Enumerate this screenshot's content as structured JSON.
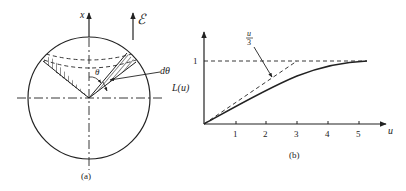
{
  "figure_a": {
    "caption": "(a)",
    "axis_label": "x",
    "field_label": "ℰ",
    "angle_label": "θ",
    "dangle_label": "dθ"
  },
  "figure_b": {
    "caption": "(b)",
    "ylabel": "L(u)",
    "xlabel": "u",
    "y_tick": "1",
    "x_ticks": [
      "1",
      "2",
      "3",
      "4",
      "5"
    ],
    "annotation_num": "u",
    "annotation_den": "3"
  },
  "colors": {
    "ink": "#222222",
    "background": "#ffffff"
  }
}
